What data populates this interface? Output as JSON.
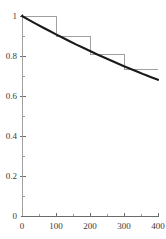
{
  "figure": {
    "width": 166,
    "height": 239,
    "background": "#ffffff",
    "title": "",
    "subtitle": ""
  },
  "style": {
    "curve_color": "#1a1a1a",
    "step_color": "#a0a0a0",
    "axis_color": "#6b6b6b",
    "minor_tick_color": "#9a9a9a",
    "label_color": "#3a3a3a"
  },
  "geometry": {
    "left_px": 22,
    "right_px": 158,
    "bottom_px": 216,
    "top_px": 16
  },
  "chart_data": {
    "type": "line",
    "title": "",
    "subtitle": "",
    "xlabel": "",
    "ylabel": "",
    "xlim": [
      0,
      400
    ],
    "ylim": [
      0,
      1
    ],
    "grid": false,
    "legend": null,
    "legend_position": "none",
    "xticks": [
      0,
      100,
      200,
      300,
      400
    ],
    "xticklabels": [
      "0",
      "100",
      "200",
      "300",
      "400"
    ],
    "xticks_minor": [
      50,
      150,
      250,
      350
    ],
    "yticks": [
      0,
      0.2,
      0.4,
      0.6,
      0.8,
      1
    ],
    "yticklabels": [
      "0",
      "0.2",
      "0.4",
      "0.6",
      "0.8",
      "1"
    ],
    "yticks_minor": [
      0.1,
      0.3,
      0.5,
      0.7,
      0.9
    ],
    "series": [
      {
        "name": "exponential-decay-curve",
        "kind": "line",
        "color": "#1a1a1a",
        "linewidth": 2.1,
        "x": [
          0,
          20,
          40,
          60,
          80,
          100,
          120,
          140,
          160,
          180,
          200,
          220,
          240,
          260,
          280,
          300,
          320,
          340,
          360,
          380,
          400
        ],
        "y": [
          1.0,
          0.981,
          0.962,
          0.944,
          0.926,
          0.908,
          0.891,
          0.874,
          0.857,
          0.841,
          0.825,
          0.809,
          0.794,
          0.779,
          0.764,
          0.749,
          0.735,
          0.721,
          0.707,
          0.694,
          0.681
        ]
      },
      {
        "name": "upper-step-function",
        "kind": "step",
        "color": "#a0a0a0",
        "linewidth": 1,
        "bin_edges": [
          0,
          100,
          200,
          300,
          400
        ],
        "values": [
          1.0,
          0.9,
          0.81,
          0.735
        ]
      }
    ]
  }
}
